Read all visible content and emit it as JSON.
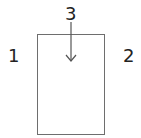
{
  "diagram": {
    "labels": {
      "left": "1",
      "right": "2",
      "top": "3"
    },
    "shapes": {
      "rectangle": "door-frame",
      "arrow": "down-arrow-into-box"
    },
    "colors": {
      "stroke": "#6e6e6e",
      "text": "#222222",
      "background": "#ffffff"
    }
  }
}
